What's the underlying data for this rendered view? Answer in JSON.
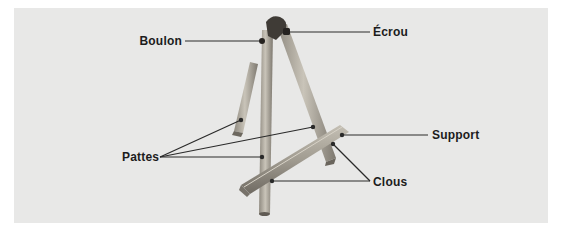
{
  "figure": {
    "background_color": "#e8e8e7",
    "line_color": "#2a2a2a",
    "wood_color": "#a9a398"
  },
  "labels": {
    "boulon": "Boulon",
    "ecrou": "Écrou",
    "pattes": "Pattes",
    "support": "Support",
    "clous": "Clous"
  }
}
